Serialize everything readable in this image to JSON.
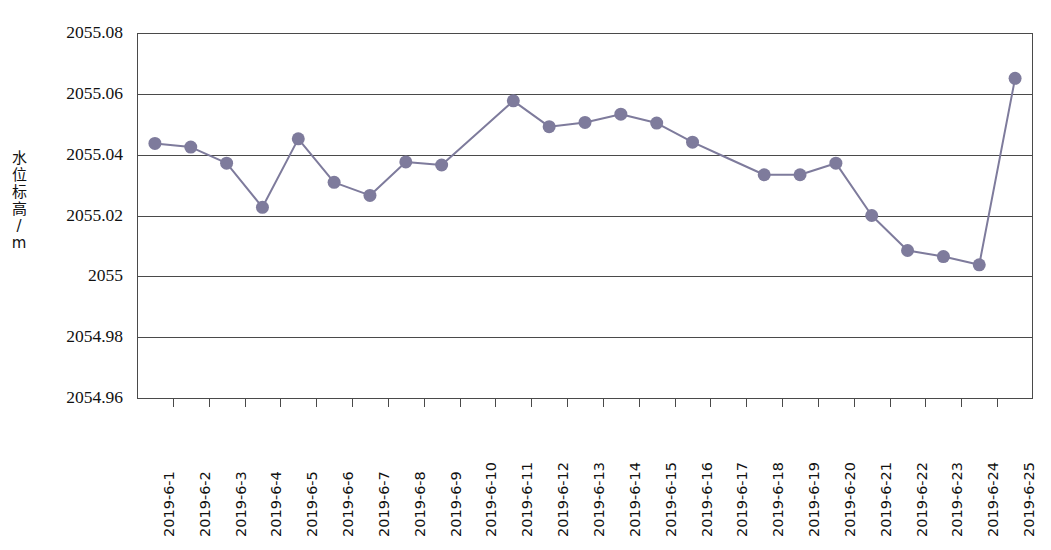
{
  "chart_data": {
    "type": "line",
    "title": "",
    "xlabel": "",
    "ylabel": "水位标高/m",
    "ylim": [
      2054.96,
      2055.08
    ],
    "ytick_labels": [
      "2055.08",
      "2055.06",
      "2055.04",
      "2055.02",
      "2055",
      "2054.98",
      "2054.96"
    ],
    "ytick_values": [
      2055.08,
      2055.06,
      2055.04,
      2055.02,
      2055.0,
      2054.98,
      2054.96
    ],
    "grid": true,
    "legend": "none",
    "marker": "circle",
    "series_color": "#7e7b9c",
    "categories": [
      "2019-6-1",
      "2019-6-2",
      "2019-6-3",
      "2019-6-4",
      "2019-6-5",
      "2019-6-6",
      "2019-6-7",
      "2019-6-8",
      "2019-6-9",
      "2019-6-10",
      "2019-6-11",
      "2019-6-12",
      "2019-6-13",
      "2019-6-14",
      "2019-6-15",
      "2019-6-16",
      "2019-6-17",
      "2019-6-18",
      "2019-6-19",
      "2019-6-20",
      "2019-6-21",
      "2019-6-22",
      "2019-6-23",
      "2019-6-24",
      "2019-6-25"
    ],
    "values": [
      2055.0437,
      2055.0425,
      2055.0372,
      2055.0227,
      2055.0452,
      2055.0309,
      2055.0266,
      2055.0376,
      2055.0366,
      null,
      2055.0577,
      2055.0492,
      2055.0506,
      2055.0533,
      2055.0504,
      2055.0441,
      null,
      2055.0334,
      2055.0334,
      2055.0372,
      2055.02,
      2055.0085,
      2055.0065,
      2055.0038,
      2055.0651
    ],
    "markers_hidden_at": [
      "2019-6-10",
      "2019-6-17"
    ]
  }
}
